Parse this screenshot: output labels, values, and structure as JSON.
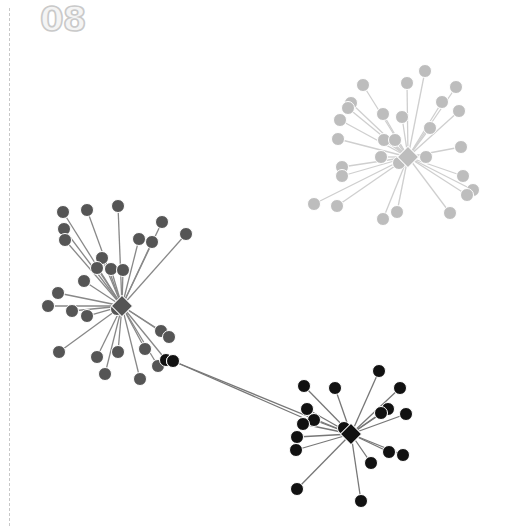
{
  "figure": {
    "label": "08",
    "width": 510,
    "height": 530
  },
  "style": {
    "edge_color": "#8a8a8a",
    "node_radius": 6.5,
    "hub_size": 15,
    "node_stroke": "#ffffff"
  },
  "clusters": [
    {
      "name": "light-grey-cluster",
      "color": "#bdbdbd",
      "edge_color": "#cfcfcf",
      "hub": {
        "x": 408,
        "y": 157
      },
      "nodes": [
        [
          425,
          71
        ],
        [
          407,
          83
        ],
        [
          363,
          85
        ],
        [
          456,
          87
        ],
        [
          442,
          102
        ],
        [
          383,
          114
        ],
        [
          351,
          103
        ],
        [
          348,
          108
        ],
        [
          402,
          117
        ],
        [
          459,
          111
        ],
        [
          340,
          120
        ],
        [
          430,
          128
        ],
        [
          384,
          140
        ],
        [
          338,
          139
        ],
        [
          395,
          140
        ],
        [
          461,
          147
        ],
        [
          381,
          157
        ],
        [
          426,
          157
        ],
        [
          399,
          163
        ],
        [
          342,
          167
        ],
        [
          342,
          176
        ],
        [
          463,
          176
        ],
        [
          473,
          190
        ],
        [
          467,
          195
        ],
        [
          314,
          204
        ],
        [
          337,
          206
        ],
        [
          450,
          213
        ],
        [
          397,
          212
        ],
        [
          383,
          219
        ]
      ]
    },
    {
      "name": "dark-grey-cluster",
      "color": "#555555",
      "edge_color": "#888888",
      "hub": {
        "x": 122,
        "y": 306
      },
      "nodes": [
        [
          63,
          212
        ],
        [
          87,
          210
        ],
        [
          118,
          206
        ],
        [
          162,
          222
        ],
        [
          186,
          234
        ],
        [
          64,
          229
        ],
        [
          65,
          240
        ],
        [
          139,
          239
        ],
        [
          152,
          242
        ],
        [
          102,
          258
        ],
        [
          97,
          268
        ],
        [
          111,
          269
        ],
        [
          123,
          270
        ],
        [
          84,
          281
        ],
        [
          58,
          293
        ],
        [
          48,
          306
        ],
        [
          72,
          311
        ],
        [
          87,
          316
        ],
        [
          117,
          309
        ],
        [
          161,
          331
        ],
        [
          169,
          337
        ],
        [
          59,
          352
        ],
        [
          97,
          357
        ],
        [
          118,
          352
        ],
        [
          145,
          349
        ],
        [
          105,
          374
        ],
        [
          158,
          366
        ],
        [
          140,
          379
        ],
        [
          166,
          360
        ]
      ]
    },
    {
      "name": "black-cluster",
      "color": "#111111",
      "edge_color": "#777777",
      "hub": {
        "x": 351,
        "y": 434
      },
      "nodes": [
        [
          379,
          371
        ],
        [
          304,
          386
        ],
        [
          335,
          388
        ],
        [
          400,
          388
        ],
        [
          388,
          409
        ],
        [
          381,
          413
        ],
        [
          406,
          414
        ],
        [
          307,
          409
        ],
        [
          314,
          420
        ],
        [
          303,
          424
        ],
        [
          297,
          437
        ],
        [
          296,
          450
        ],
        [
          389,
          452
        ],
        [
          403,
          455
        ],
        [
          371,
          463
        ],
        [
          297,
          489
        ],
        [
          361,
          501
        ],
        [
          173,
          361
        ],
        [
          344,
          428
        ]
      ]
    }
  ],
  "inter_cluster_edges": [
    {
      "from": [
        173,
        361
      ],
      "to": [
        308,
        420
      ],
      "color": "#777777"
    }
  ]
}
